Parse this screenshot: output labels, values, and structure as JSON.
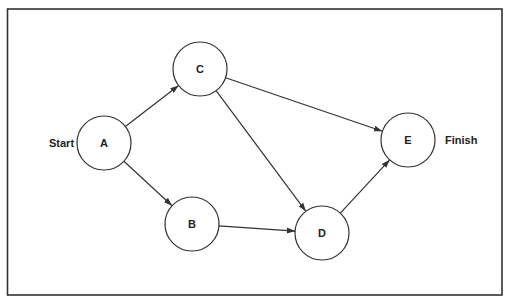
{
  "diagram": {
    "type": "network-activity-diagram",
    "start_label": "Start",
    "finish_label": "Finish",
    "nodes": [
      {
        "id": "A",
        "label": "A",
        "cx": 104,
        "cy": 143,
        "r": 27
      },
      {
        "id": "C",
        "label": "C",
        "cx": 200,
        "cy": 69,
        "r": 27
      },
      {
        "id": "B",
        "label": "B",
        "cx": 192,
        "cy": 224,
        "r": 27
      },
      {
        "id": "D",
        "label": "D",
        "cx": 322,
        "cy": 233,
        "r": 27
      },
      {
        "id": "E",
        "label": "E",
        "cx": 408,
        "cy": 140,
        "r": 27
      }
    ],
    "edges": [
      {
        "from": "A",
        "to": "C"
      },
      {
        "from": "A",
        "to": "B"
      },
      {
        "from": "C",
        "to": "E"
      },
      {
        "from": "C",
        "to": "D"
      },
      {
        "from": "B",
        "to": "D"
      },
      {
        "from": "D",
        "to": "E"
      }
    ],
    "colors": {
      "stroke": "#333333",
      "background": "#ffffff"
    }
  }
}
